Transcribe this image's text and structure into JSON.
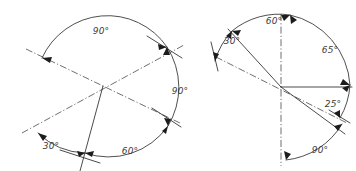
{
  "document": {
    "title": "Angular dimensioning exercise",
    "background_color": "#ffffff",
    "line_color": "#2b2b2b",
    "center_line_color": "#4a4a4a",
    "text_color": "#3a3a3a"
  },
  "figures": [
    {
      "id": "left-figure",
      "name": "left-angle-diagram",
      "center": {
        "x": 103,
        "y": 86
      },
      "dimensions": [
        {
          "id": "left-dim-90-top",
          "label": "90°",
          "value": 90,
          "unit": "degrees",
          "label_x": 101,
          "label_y": 31
        },
        {
          "id": "left-dim-90-right",
          "label": "90°",
          "value": 90,
          "unit": "degrees",
          "label_x": 180,
          "label_y": 91
        },
        {
          "id": "left-dim-30",
          "label": "30°",
          "value": 30,
          "unit": "degrees",
          "label_x": 51,
          "label_y": 146
        },
        {
          "id": "left-dim-60",
          "label": "60°",
          "value": 60,
          "unit": "degrees",
          "label_x": 130,
          "label_y": 151
        }
      ]
    },
    {
      "id": "right-figure",
      "name": "right-angle-diagram",
      "center": {
        "x": 281,
        "y": 87
      },
      "dimensions": [
        {
          "id": "right-dim-30",
          "label": "30°",
          "value": 30,
          "unit": "degrees",
          "label_x": 232,
          "label_y": 41
        },
        {
          "id": "right-dim-60",
          "label": "60°",
          "value": 60,
          "unit": "degrees",
          "label_x": 274,
          "label_y": 21
        },
        {
          "id": "right-dim-65",
          "label": "65°",
          "value": 65,
          "unit": "degrees",
          "label_x": 330,
          "label_y": 50
        },
        {
          "id": "right-dim-25",
          "label": "25°",
          "value": 25,
          "unit": "degrees",
          "label_x": 333,
          "label_y": 104
        },
        {
          "id": "right-dim-90",
          "label": "90°",
          "value": 90,
          "unit": "degrees",
          "label_x": 320,
          "label_y": 150
        }
      ]
    }
  ]
}
